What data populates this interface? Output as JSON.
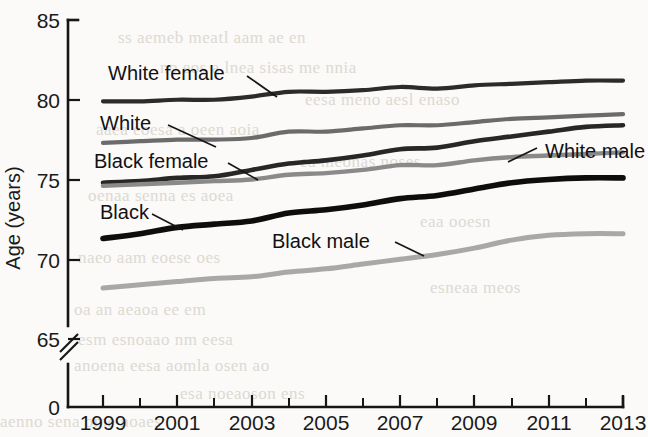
{
  "chart_data": {
    "type": "line",
    "title": "",
    "xlabel": "",
    "ylabel": "Age (years)",
    "xlim": [
      1999,
      2013
    ],
    "ylim": [
      65,
      85
    ],
    "y_axis_break": true,
    "y_zero_shown": true,
    "grid": false,
    "legend_position": "inline-annotations",
    "x": [
      1999,
      2000,
      2001,
      2002,
      2003,
      2004,
      2005,
      2006,
      2007,
      2008,
      2009,
      2010,
      2011,
      2012,
      2013
    ],
    "x_tick_labels": [
      "1999",
      "",
      "2001",
      "",
      "2003",
      "",
      "2005",
      "",
      "2007",
      "",
      "2009",
      "",
      "2011",
      "",
      "2013"
    ],
    "y_tick_labels": [
      "85",
      "80",
      "75",
      "70",
      "65",
      "0"
    ],
    "y_ticks": [
      85,
      80,
      75,
      70,
      65
    ],
    "series": [
      {
        "name": "White female",
        "color": "#2b2b2b",
        "width": 4.2,
        "values": [
          79.9,
          79.9,
          80.0,
          80.0,
          80.2,
          80.5,
          80.5,
          80.6,
          80.8,
          80.7,
          80.9,
          81.0,
          81.1,
          81.2,
          81.2
        ]
      },
      {
        "name": "White",
        "color": "#6b6b6b",
        "width": 4.2,
        "values": [
          77.3,
          77.4,
          77.5,
          77.5,
          77.6,
          78.0,
          78.0,
          78.2,
          78.4,
          78.4,
          78.6,
          78.8,
          78.9,
          79.0,
          79.1
        ]
      },
      {
        "name": "Black female",
        "color": "#272727",
        "width": 4.6,
        "values": [
          74.8,
          74.9,
          75.1,
          75.2,
          75.6,
          76.0,
          76.2,
          76.5,
          76.9,
          77.0,
          77.4,
          77.7,
          78.0,
          78.3,
          78.4
        ]
      },
      {
        "name": "White male",
        "color": "#8a8a8a",
        "width": 4.4,
        "values": [
          74.6,
          74.7,
          74.8,
          74.9,
          75.0,
          75.3,
          75.4,
          75.6,
          75.9,
          75.9,
          76.2,
          76.4,
          76.5,
          76.6,
          76.7
        ]
      },
      {
        "name": "Black",
        "color": "#0d0d0d",
        "width": 5.6,
        "values": [
          71.3,
          71.6,
          72.0,
          72.2,
          72.4,
          72.9,
          73.1,
          73.4,
          73.8,
          74.0,
          74.4,
          74.8,
          75.0,
          75.1,
          75.1
        ]
      },
      {
        "name": "Black male",
        "color": "#a8a8a8",
        "width": 5.0,
        "values": [
          68.2,
          68.4,
          68.6,
          68.8,
          68.9,
          69.2,
          69.4,
          69.7,
          70.0,
          70.3,
          70.7,
          71.2,
          71.5,
          71.6,
          71.6
        ]
      }
    ],
    "annotations": [
      {
        "text": "White female",
        "series": "White female"
      },
      {
        "text": "White",
        "series": "White"
      },
      {
        "text": "Black female",
        "series": "Black female"
      },
      {
        "text": "Black",
        "series": "Black"
      },
      {
        "text": "White male",
        "series": "White male"
      },
      {
        "text": "Black male",
        "series": "Black male"
      }
    ]
  },
  "labels": {
    "y_axis_title": "Age (years)",
    "y85": "85",
    "y80": "80",
    "y75": "75",
    "y70": "70",
    "y65": "65",
    "y0": "0",
    "x1999": "1999",
    "x2001": "2001",
    "x2003": "2003",
    "x2005": "2005",
    "x2007": "2007",
    "x2009": "2009",
    "x2011": "2011",
    "x2013": "2013",
    "ann_white_female": "White female",
    "ann_white": "White",
    "ann_black_female": "Black female",
    "ann_black": "Black",
    "ann_white_male": "White male",
    "ann_black_male": "Black male"
  },
  "background_bleed": {
    "line1": "of the page showing through",
    "line2": "and a second faint row",
    "line3": "reverse side text visible",
    "line4": "scanned paper artifact"
  }
}
